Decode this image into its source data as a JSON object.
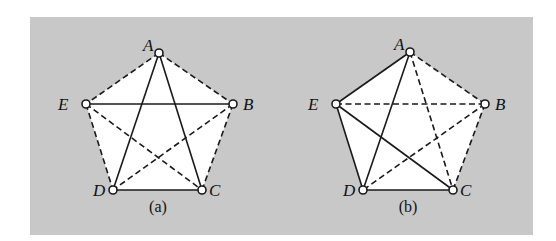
{
  "figure": {
    "background": {
      "x": 30,
      "y": 17,
      "width": 503,
      "height": 218,
      "color": "#c8c8c8"
    },
    "edge_color": "#1a1a1a",
    "fill_color": "#ffffff",
    "graphs": [
      {
        "id": "a",
        "caption": "(a)",
        "caption_pos": [
          158,
          212
        ],
        "nodes": [
          {
            "label": "A",
            "x": 159,
            "y": 53,
            "lx": -16,
            "ly": -2
          },
          {
            "label": "B",
            "x": 233,
            "y": 104,
            "lx": 10,
            "ly": 6
          },
          {
            "label": "C",
            "x": 202,
            "y": 190,
            "lx": 7,
            "ly": 6
          },
          {
            "label": "D",
            "x": 113,
            "y": 190,
            "lx": -20,
            "ly": 6
          },
          {
            "label": "E",
            "x": 86,
            "y": 104,
            "lx": -28,
            "ly": 6
          }
        ],
        "edges": [
          {
            "from": "A",
            "to": "D",
            "style": "solid"
          },
          {
            "from": "A",
            "to": "C",
            "style": "solid"
          },
          {
            "from": "E",
            "to": "B",
            "style": "solid"
          },
          {
            "from": "D",
            "to": "C",
            "style": "solid"
          },
          {
            "from": "A",
            "to": "E",
            "style": "dashed"
          },
          {
            "from": "A",
            "to": "B",
            "style": "dashed"
          },
          {
            "from": "E",
            "to": "D",
            "style": "dashed"
          },
          {
            "from": "E",
            "to": "C",
            "style": "dashed"
          },
          {
            "from": "B",
            "to": "D",
            "style": "dashed"
          },
          {
            "from": "B",
            "to": "C",
            "style": "dashed"
          }
        ]
      },
      {
        "id": "b",
        "caption": "(b)",
        "caption_pos": [
          408,
          212
        ],
        "nodes": [
          {
            "label": "A",
            "x": 410,
            "y": 52,
            "lx": -16,
            "ly": -2
          },
          {
            "label": "B",
            "x": 485,
            "y": 104,
            "lx": 10,
            "ly": 6
          },
          {
            "label": "C",
            "x": 453,
            "y": 190,
            "lx": 7,
            "ly": 6
          },
          {
            "label": "D",
            "x": 363,
            "y": 190,
            "lx": -20,
            "ly": 6
          },
          {
            "label": "E",
            "x": 336,
            "y": 104,
            "lx": -28,
            "ly": 6
          }
        ],
        "edges": [
          {
            "from": "A",
            "to": "E",
            "style": "solid"
          },
          {
            "from": "A",
            "to": "D",
            "style": "solid"
          },
          {
            "from": "E",
            "to": "D",
            "style": "solid"
          },
          {
            "from": "E",
            "to": "C",
            "style": "solid"
          },
          {
            "from": "D",
            "to": "C",
            "style": "solid"
          },
          {
            "from": "A",
            "to": "B",
            "style": "dashed"
          },
          {
            "from": "A",
            "to": "C",
            "style": "dashed"
          },
          {
            "from": "E",
            "to": "B",
            "style": "dashed"
          },
          {
            "from": "B",
            "to": "D",
            "style": "dashed"
          },
          {
            "from": "B",
            "to": "C",
            "style": "dashed"
          }
        ]
      }
    ]
  }
}
